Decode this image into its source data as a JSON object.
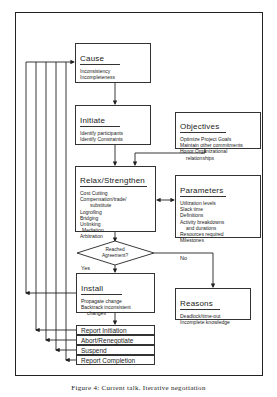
{
  "diagram": {
    "nodes": {
      "cause": {
        "title": "Cause",
        "items": [
          "Inconsistency",
          "Incompleteness"
        ]
      },
      "initiate": {
        "title": "Initiate",
        "items": [
          "Identify participants",
          "Identify Constraints"
        ]
      },
      "objectives": {
        "title": "Objectives",
        "items": [
          "Optimize Project Goals",
          "Maintain other commitments",
          "Honor Organizational",
          "relationships"
        ]
      },
      "relax": {
        "title": "Relax/Strengthen",
        "items": [
          "Cost Cutting",
          "Compensation/trade/",
          "substitute",
          "Logrolling",
          "Bridging",
          "Unlinking",
          "Mediation",
          "Arbitration"
        ]
      },
      "parameters": {
        "title": "Parameters",
        "items": [
          "Utilization levels",
          "Slack time",
          "Definitions",
          "Activity breakdowns",
          "and durations",
          "Resources required",
          "Milestones"
        ]
      },
      "decision": {
        "line1": "Reached",
        "line2": "Agreement?",
        "yes": "Yes",
        "no": "No"
      },
      "install": {
        "title": "Install",
        "items": [
          "Propagate change",
          "Backtrack inconsistent",
          "changes"
        ]
      },
      "reasons": {
        "title": "Reasons",
        "items": [
          "Deadlock/time-out",
          "Incomplete knowledge"
        ]
      },
      "outcomes": [
        "Report Initiation",
        "Abort/Renegotiate",
        "Suspend",
        "Report Completion"
      ]
    },
    "caption": "Figure 4: Current talk. Iterative negotiation"
  }
}
